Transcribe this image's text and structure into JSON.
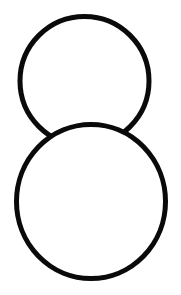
{
  "figure": {
    "background": "#ffffff",
    "stroke_color": "#0a0a0a",
    "fill_color": "#ffffff",
    "stroke_width": 5,
    "shapes": [
      {
        "name": "top-circle",
        "cx": 84.5,
        "cy": 81,
        "rx": 64.5,
        "ry": 64.5
      },
      {
        "name": "bottom-circle",
        "cx": 91,
        "cy": 201.5,
        "rx": 74.5,
        "ry": 77
      }
    ]
  }
}
